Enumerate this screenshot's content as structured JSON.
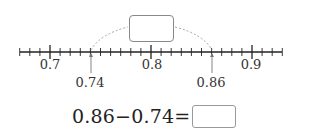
{
  "number_line": {
    "min": 0.67,
    "max": 0.93,
    "minor_step": 0.01,
    "major_ticks": [
      {
        "value": 0.7,
        "label": "0.7"
      },
      {
        "value": 0.8,
        "label": "0.8"
      },
      {
        "value": 0.9,
        "label": "0.9"
      }
    ],
    "marked_points": [
      {
        "value": 0.74,
        "label": "0.74"
      },
      {
        "value": 0.86,
        "label": "0.86"
      }
    ],
    "arc": {
      "from": 0.74,
      "to": 0.86,
      "style": "dashed"
    },
    "difference_box": {
      "value": ""
    }
  },
  "equation": {
    "text": "0.86−0.74=",
    "answer": ""
  }
}
